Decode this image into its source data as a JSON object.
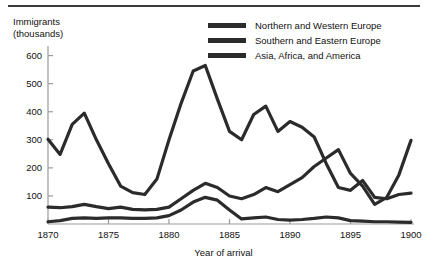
{
  "chart_data": {
    "type": "line",
    "title": "",
    "subtitle": "",
    "xlabel": "Year of arrival",
    "ylabel": "Immigrants\n(thousands)",
    "xlim": [
      1870,
      1900
    ],
    "ylim": [
      0,
      620
    ],
    "grid": false,
    "legend_position": "top-right",
    "xticks": [
      1870,
      1875,
      1880,
      1885,
      1890,
      1895,
      1900
    ],
    "xtick_labels": [
      "1870",
      "1875",
      "1880",
      "1885",
      "1890",
      "1895",
      "1900"
    ],
    "yticks": [
      100,
      200,
      300,
      400,
      500,
      600
    ],
    "ytick_labels": [
      "100",
      "200",
      "300",
      "400",
      "500",
      "600"
    ],
    "line_color": "#2b2b2b",
    "axis_color": "#9a9a9a",
    "x": [
      1870,
      1871,
      1872,
      1873,
      1874,
      1875,
      1876,
      1877,
      1878,
      1879,
      1880,
      1881,
      1882,
      1883,
      1884,
      1885,
      1886,
      1887,
      1888,
      1889,
      1890,
      1891,
      1892,
      1893,
      1894,
      1895,
      1896,
      1897,
      1898,
      1899,
      1900
    ],
    "series": [
      {
        "name": "Northern and Western Europe",
        "values": [
          302,
          248,
          355,
          395,
          300,
          215,
          135,
          112,
          105,
          160,
          300,
          430,
          545,
          565,
          445,
          330,
          300,
          390,
          420,
          330,
          365,
          345,
          310,
          215,
          130,
          120,
          155,
          95,
          90,
          105,
          110
        ]
      },
      {
        "name": "Southern and Eastern Europe",
        "values": [
          60,
          58,
          62,
          70,
          62,
          55,
          60,
          52,
          50,
          52,
          60,
          90,
          120,
          145,
          130,
          100,
          90,
          105,
          130,
          115,
          140,
          165,
          205,
          235,
          265,
          180,
          135,
          70,
          95,
          175,
          298
        ]
      },
      {
        "name": "Asia, Africa, and America",
        "values": [
          8,
          12,
          20,
          22,
          20,
          22,
          22,
          20,
          20,
          22,
          30,
          50,
          78,
          95,
          85,
          50,
          18,
          22,
          25,
          16,
          14,
          16,
          20,
          25,
          22,
          12,
          10,
          8,
          8,
          7,
          6
        ]
      }
    ]
  }
}
